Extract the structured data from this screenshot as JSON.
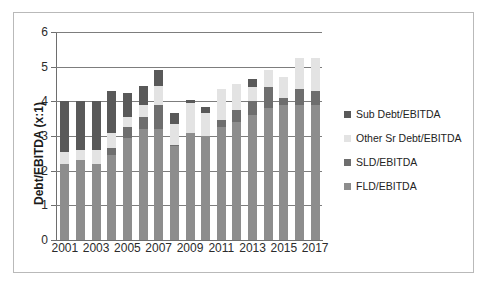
{
  "chart_data": {
    "type": "bar",
    "subtype": "stacked-column",
    "title": "",
    "xlabel": "",
    "ylabel": "Debt/EBITDA (x:1)",
    "ylim": [
      0,
      6
    ],
    "yticks": [
      0,
      1,
      2,
      3,
      4,
      5,
      6
    ],
    "ytick_labels": [
      "0",
      "1",
      "2",
      "3",
      "4",
      "5",
      "6"
    ],
    "grid": true,
    "grid_axis": "y",
    "legend_position": "right",
    "categories": [
      "2001",
      "2002",
      "2003",
      "2004",
      "2005",
      "2006",
      "2007",
      "2008",
      "2009",
      "2010",
      "2011",
      "2012",
      "2013",
      "2014",
      "2015",
      "2016",
      "2017"
    ],
    "xtick_labels": [
      "2001",
      "2003",
      "2005",
      "2007",
      "2009",
      "2011",
      "2013",
      "2015",
      "2017"
    ],
    "xtick_categories": [
      "2001",
      "2003",
      "2005",
      "2007",
      "2009",
      "2011",
      "2013",
      "2015",
      "2017"
    ],
    "series": [
      {
        "name": "FLD/EBITDA",
        "color": "#8d8d8d",
        "values": [
          2.2,
          2.3,
          2.2,
          2.45,
          2.95,
          3.2,
          3.2,
          2.7,
          3.1,
          3.0,
          3.25,
          3.4,
          3.6,
          3.8,
          3.9,
          3.9,
          3.9
        ]
      },
      {
        "name": "SLD/EBITDA",
        "color": "#6e6e6e",
        "values": [
          0.0,
          0.0,
          0.0,
          0.2,
          0.3,
          0.35,
          0.7,
          0.05,
          0.0,
          0.0,
          0.2,
          0.35,
          0.4,
          0.6,
          0.2,
          0.45,
          0.4
        ]
      },
      {
        "name": "Other Sr Debt/EBITDA",
        "color": "#e3e3e3",
        "values": [
          0.35,
          0.3,
          0.4,
          0.45,
          0.3,
          0.35,
          0.55,
          0.6,
          0.85,
          0.65,
          0.9,
          0.75,
          0.4,
          0.5,
          0.6,
          0.9,
          0.95
        ]
      },
      {
        "name": "Sub Debt/EBITDA",
        "color": "#595959",
        "values": [
          1.45,
          1.4,
          1.4,
          1.2,
          0.7,
          0.55,
          0.45,
          0.3,
          0.1,
          0.2,
          0.0,
          0.0,
          0.25,
          0.0,
          0.0,
          0.0,
          0.0
        ]
      }
    ],
    "stack_order_bottom_to_top": [
      "FLD/EBITDA",
      "SLD/EBITDA",
      "Other Sr Debt/EBITDA",
      "Sub Debt/EBITDA"
    ],
    "totals": [
      4.0,
      4.0,
      4.0,
      4.3,
      4.25,
      4.45,
      4.9,
      3.65,
      4.05,
      3.85,
      4.35,
      4.5,
      4.65,
      4.9,
      4.7,
      5.25,
      5.25
    ]
  },
  "legend": {
    "items": [
      {
        "label": "Sub Debt/EBITDA",
        "color": "#595959"
      },
      {
        "label": "Other Sr Debt/EBITDA",
        "color": "#e3e3e3"
      },
      {
        "label": "SLD/EBITDA",
        "color": "#6e6e6e"
      },
      {
        "label": "FLD/EBITDA",
        "color": "#8d8d8d"
      }
    ]
  }
}
